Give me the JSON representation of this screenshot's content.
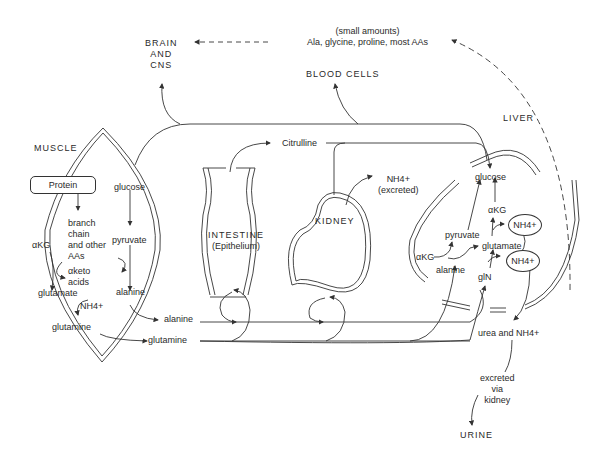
{
  "organs": {
    "brain": "BRAIN\nAND\nCNS",
    "brain_lines": [
      "BRAIN",
      "AND",
      "CNS"
    ],
    "blood_cells": "BLOOD CELLS",
    "muscle": "MUSCLE",
    "intestine": "INTESTINE",
    "intestine_sub": "(Epithelium)",
    "kidney": "KIDNEY",
    "liver": "LIVER",
    "urine": "URINE"
  },
  "brain_supply": {
    "line1": "(small amounts)",
    "line2": "Ala, glycine, proline, most AAs"
  },
  "muscle": {
    "protein": "Protein",
    "branch_chain": [
      "branch",
      "chain",
      "and other",
      "AAs"
    ],
    "aketo_acids": [
      "αketo",
      "acids"
    ],
    "akg": "αKG",
    "glutamate": "glutamate",
    "nh4": "NH4+",
    "glutamine": "glutamine",
    "glucose": "glucose",
    "pyruvate": "pyruvate",
    "alanine": "alanine"
  },
  "blood": {
    "alanine": "alanine",
    "glutamine": "glutamine",
    "citrulline": "Citrulline"
  },
  "kidney": {
    "nh4": "NH4+",
    "excreted": "(excreted)"
  },
  "liver": {
    "glucose": "glucose",
    "akg_top": "αKG",
    "nh4_top": "NH4+",
    "pyruvate": "pyruvate",
    "glutamate": "glutamate",
    "akg_left": "αKG",
    "alanine": "alanine",
    "nh4_bottom": "NH4+",
    "gln": "glN",
    "urea": "urea and NH4+",
    "excreted": [
      "excreted",
      "via",
      "kidney"
    ]
  }
}
